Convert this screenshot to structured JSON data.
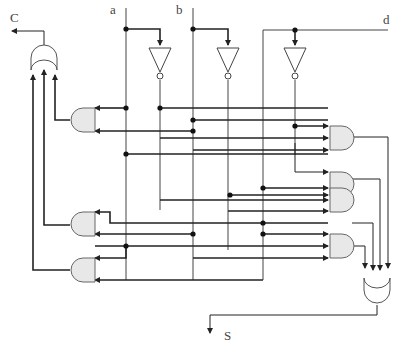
{
  "diagram": {
    "type": "logic-circuit",
    "inputs": [
      "a",
      "b",
      "d"
    ],
    "outputs": [
      "C",
      "S"
    ],
    "labels": {
      "a": "a",
      "b": "b",
      "d": "d",
      "C": "C",
      "S": "S"
    },
    "gates": {
      "not": [
        "NOT a",
        "NOT b",
        "NOT d"
      ],
      "and_right": [
        "AND 1",
        "AND 2",
        "AND 3",
        "AND 4"
      ],
      "and_left": [
        "AND 5",
        "AND 6",
        "AND 7"
      ],
      "or": [
        "OR S",
        "OR C"
      ]
    },
    "colors": {
      "wire": "#333333",
      "gate_fill": "#e8e8e8",
      "gate_stroke": "#555555"
    }
  }
}
